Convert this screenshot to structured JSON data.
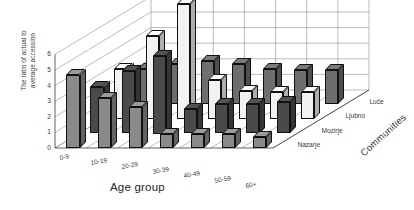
{
  "chart_data": {
    "type": "bar",
    "subtype": "3d-grouped-bar",
    "title": "",
    "xlabel": "Age group",
    "ylabel": "The ratio of actual to average accession",
    "zlabel": "Communities",
    "categories": [
      "0-9",
      "10-19",
      "20-29",
      "30-39",
      "40-49",
      "50-59",
      "60+"
    ],
    "yticks": [
      "0",
      "1",
      "2",
      "3",
      "4",
      "5",
      "6"
    ],
    "ylim": [
      0,
      6
    ],
    "grid": true,
    "legend_position": "axis-depth-labels",
    "series": [
      {
        "name": "Luče",
        "color": "#8a8a8a",
        "values": [
          4.7,
          3.2,
          2.6,
          0.9,
          0.9,
          0.9,
          0.7
        ]
      },
      {
        "name": "Ljubno",
        "color": "#4a4a4a",
        "values": [
          3.0,
          4.0,
          5.0,
          1.6,
          1.9,
          1.9,
          2.0
        ]
      },
      {
        "name": "Mozirje",
        "color": "#f2f2f2",
        "values": [
          3.2,
          5.3,
          7.4,
          2.5,
          1.8,
          1.7,
          1.7
        ]
      },
      {
        "name": "Nazarje",
        "color": "#6e6e6e",
        "values": [
          2.3,
          2.6,
          2.8,
          2.6,
          2.3,
          2.2,
          2.2
        ]
      }
    ]
  }
}
